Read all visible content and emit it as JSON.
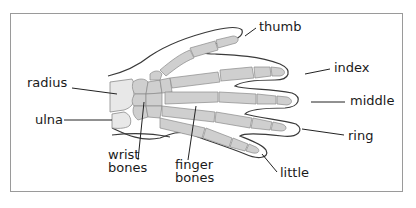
{
  "diagram": {
    "colors": {
      "bone": "#cfcfcf",
      "bone_outline": "#8a8a8a",
      "forearm_bone": "#e8e8e8",
      "skin_outline": "#3a3a3a",
      "leader_line": "#222222",
      "frame": "#9a9a9a",
      "text": "#1a1a1a"
    },
    "labels": {
      "thumb": "thumb",
      "index": "index",
      "middle": "middle",
      "ring": "ring",
      "little": "little",
      "radius": "radius",
      "ulna": "ulna",
      "wrist_bones": "wrist\nbones",
      "finger_bones": "finger\nbones"
    }
  }
}
